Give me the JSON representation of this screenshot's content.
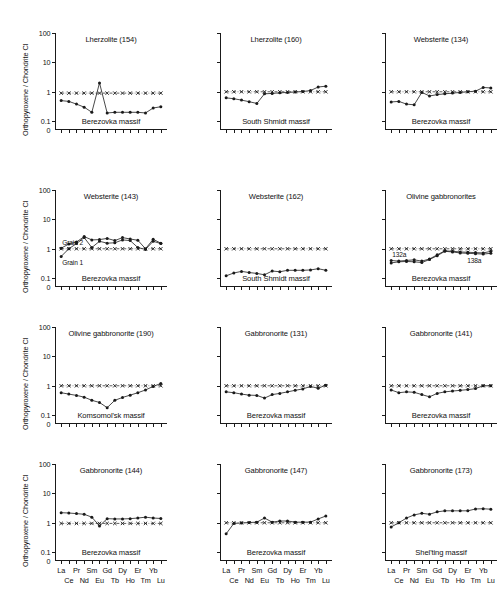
{
  "figure": {
    "y_axis_label": "Orthopyroxene / Chondrite CI",
    "y_ticks": [
      "100",
      "10",
      "1",
      "0.1",
      "0"
    ],
    "x_categories": [
      "La",
      "Ce",
      "Pr",
      "Nd",
      "Sm",
      "Eu",
      "Gd",
      "Tb",
      "Dy",
      "Ho",
      "Er",
      "Tm",
      "Yb",
      "Lu"
    ],
    "x_row_top": [
      "La",
      "Pr",
      "Sm",
      "Gd",
      "Dy",
      "Er",
      "Yb"
    ],
    "x_row_bottom": [
      "Ce",
      "Nd",
      "Eu",
      "Tb",
      "Ho",
      "Tm",
      "Lu"
    ],
    "reference_line_label": "Chondrite CI reference",
    "caption": ""
  },
  "chart_data": [
    {
      "type": "line",
      "title": "Lherzolite (154)",
      "massif": "Berezovka massif",
      "xlabel": "",
      "ylabel": "Orthopyroxene / Chondrite CI",
      "categories": [
        "La",
        "Ce",
        "Pr",
        "Nd",
        "Sm",
        "Eu",
        "Gd",
        "Tb",
        "Dy",
        "Ho",
        "Er",
        "Tm",
        "Yb",
        "Lu"
      ],
      "ylim": [
        0.05,
        100
      ],
      "log_scale": true,
      "series": [
        {
          "name": "sample",
          "marker": "filled-circle",
          "values": [
            0.5,
            0.47,
            0.38,
            0.3,
            0.2,
            2.0,
            0.19,
            0.2,
            0.2,
            0.2,
            0.2,
            0.19,
            0.28,
            0.31
          ]
        },
        {
          "name": "chondrite-reference",
          "marker": "cross",
          "line": "dash-dot",
          "values": [
            0.9,
            0.9,
            0.9,
            0.9,
            0.9,
            0.9,
            0.9,
            0.9,
            0.9,
            0.9,
            0.9,
            0.9,
            0.9,
            0.9
          ]
        }
      ],
      "annotations": []
    },
    {
      "type": "line",
      "title": "Lherzolite (160)",
      "massif": "South Shmidt massif",
      "categories": [
        "La",
        "Ce",
        "Pr",
        "Nd",
        "Sm",
        "Eu",
        "Gd",
        "Tb",
        "Dy",
        "Ho",
        "Er",
        "Tm",
        "Yb",
        "Lu"
      ],
      "ylim": [
        0.05,
        100
      ],
      "log_scale": true,
      "series": [
        {
          "name": "sample",
          "marker": "filled-circle",
          "values": [
            0.62,
            0.58,
            0.52,
            0.46,
            0.4,
            0.85,
            0.88,
            0.92,
            0.95,
            0.98,
            1.02,
            1.1,
            1.45,
            1.55
          ]
        },
        {
          "name": "chondrite-reference",
          "marker": "cross",
          "line": "dash-dot",
          "values": [
            1,
            1,
            1,
            1,
            1,
            1,
            1,
            1,
            1,
            1,
            1,
            1,
            1,
            1
          ]
        }
      ],
      "annotations": []
    },
    {
      "type": "line",
      "title": "Websterite (134)",
      "massif": "Berezovka massif",
      "categories": [
        "La",
        "Ce",
        "Pr",
        "Nd",
        "Sm",
        "Eu",
        "Gd",
        "Tb",
        "Dy",
        "Ho",
        "Er",
        "Tm",
        "Yb",
        "Lu"
      ],
      "ylim": [
        0.05,
        100
      ],
      "log_scale": true,
      "series": [
        {
          "name": "sample",
          "marker": "filled-circle",
          "values": [
            0.45,
            0.47,
            0.38,
            0.36,
            0.95,
            0.72,
            0.8,
            0.85,
            0.9,
            0.95,
            1.0,
            1.05,
            1.4,
            1.35
          ]
        },
        {
          "name": "chondrite-reference",
          "marker": "cross",
          "line": "dash-dot",
          "values": [
            1,
            1,
            1,
            1,
            1,
            1,
            1,
            1,
            1,
            1,
            1,
            1,
            1,
            1
          ]
        }
      ],
      "annotations": []
    },
    {
      "type": "line",
      "title": "Websterite (143)",
      "massif": "Berezovka massif",
      "categories": [
        "La",
        "Ce",
        "Pr",
        "Nd",
        "Sm",
        "Eu",
        "Gd",
        "Tb",
        "Dy",
        "Ho",
        "Er",
        "Tm",
        "Yb",
        "Lu"
      ],
      "ylim": [
        0.05,
        100
      ],
      "log_scale": true,
      "series": [
        {
          "name": "Grain 2",
          "marker": "filled-circle",
          "values": [
            1.05,
            1.45,
            1.7,
            2.6,
            2.0,
            2.05,
            2.25,
            1.9,
            2.4,
            2.15,
            1.95,
            1.0,
            2.1,
            1.55
          ]
        },
        {
          "name": "Grain 1",
          "marker": "filled-circle",
          "values": [
            0.55,
            1.0,
            1.5,
            2.4,
            1.1,
            1.8,
            1.55,
            1.6,
            2.0,
            1.9,
            1.1,
            0.95,
            1.8,
            1.5
          ]
        },
        {
          "name": "chondrite-reference",
          "marker": "cross",
          "line": "dash-dot",
          "values": [
            1,
            1,
            1,
            1,
            1,
            1,
            1,
            1,
            1,
            1,
            1,
            1,
            1,
            1
          ]
        }
      ],
      "annotations": [
        {
          "text": "Grain 2",
          "category": "La",
          "position": "above"
        },
        {
          "text": "Grain 1",
          "category": "La",
          "position": "below"
        }
      ]
    },
    {
      "type": "line",
      "title": "Websterite (162)",
      "massif": "South Shmidt massif",
      "categories": [
        "La",
        "Ce",
        "Pr",
        "Nd",
        "Sm",
        "Eu",
        "Gd",
        "Tb",
        "Dy",
        "Ho",
        "Er",
        "Tm",
        "Yb",
        "Lu"
      ],
      "ylim": [
        0.05,
        100
      ],
      "log_scale": true,
      "series": [
        {
          "name": "sample",
          "marker": "filled-circle",
          "values": [
            0.12,
            0.15,
            0.17,
            0.155,
            0.145,
            0.13,
            0.175,
            0.165,
            0.185,
            0.185,
            0.185,
            0.19,
            0.21,
            0.185
          ]
        },
        {
          "name": "chondrite-reference",
          "marker": "cross",
          "line": "dash-dot",
          "values": [
            1,
            1,
            1,
            1,
            1,
            1,
            1,
            1,
            1,
            1,
            1,
            1,
            1,
            1
          ]
        }
      ],
      "annotations": []
    },
    {
      "type": "line",
      "title": "Olivine gabbronorites",
      "massif": "Berezovka massif",
      "categories": [
        "La",
        "Ce",
        "Pr",
        "Nd",
        "Sm",
        "Eu",
        "Gd",
        "Tb",
        "Dy",
        "Ho",
        "Er",
        "Tm",
        "Yb",
        "Lu"
      ],
      "ylim": [
        0.05,
        100
      ],
      "log_scale": true,
      "series": [
        {
          "name": "132a",
          "marker": "filled-circle",
          "values": [
            0.4,
            0.38,
            0.4,
            0.42,
            0.38,
            0.45,
            0.62,
            0.85,
            0.82,
            0.78,
            0.76,
            0.74,
            0.72,
            0.82
          ]
        },
        {
          "name": "138a",
          "marker": "filled-circle",
          "values": [
            0.33,
            0.36,
            0.37,
            0.36,
            0.34,
            0.43,
            0.58,
            0.82,
            0.78,
            0.72,
            0.7,
            0.68,
            0.66,
            0.7
          ]
        },
        {
          "name": "chondrite-reference",
          "marker": "cross",
          "line": "dash-dot",
          "values": [
            1,
            1,
            1,
            1,
            1,
            1,
            1,
            1,
            1,
            1,
            1,
            1,
            1,
            1
          ]
        }
      ],
      "annotations": [
        {
          "text": "132a",
          "category": "La",
          "position": "above"
        },
        {
          "text": "138a",
          "category": "Yb",
          "position": "below"
        }
      ]
    },
    {
      "type": "line",
      "title": "Olivine gabbronorite (190)",
      "massif": "Komsomol'sk massif",
      "categories": [
        "La",
        "Ce",
        "Pr",
        "Nd",
        "Sm",
        "Eu",
        "Gd",
        "Tb",
        "Dy",
        "Ho",
        "Er",
        "Tm",
        "Yb",
        "Lu"
      ],
      "ylim": [
        0.05,
        100
      ],
      "log_scale": true,
      "series": [
        {
          "name": "sample",
          "marker": "filled-circle",
          "values": [
            0.58,
            0.52,
            0.47,
            0.41,
            0.32,
            0.27,
            0.18,
            0.32,
            0.4,
            0.48,
            0.58,
            0.72,
            0.95,
            1.2
          ]
        },
        {
          "name": "chondrite-reference",
          "marker": "cross",
          "line": "dash-dot",
          "values": [
            1,
            1,
            1,
            1,
            1,
            1,
            1,
            1,
            1,
            1,
            1,
            1,
            1,
            1
          ]
        }
      ],
      "annotations": []
    },
    {
      "type": "line",
      "title": "Gabbronorite (131)",
      "massif": "Berezovka massif",
      "categories": [
        "La",
        "Ce",
        "Pr",
        "Nd",
        "Sm",
        "Eu",
        "Gd",
        "Tb",
        "Dy",
        "Ho",
        "Er",
        "Tm",
        "Yb",
        "Lu"
      ],
      "ylim": [
        0.05,
        100
      ],
      "log_scale": true,
      "series": [
        {
          "name": "sample",
          "marker": "filled-circle",
          "values": [
            0.62,
            0.58,
            0.52,
            0.48,
            0.47,
            0.38,
            0.5,
            0.55,
            0.62,
            0.7,
            0.78,
            0.95,
            0.82,
            1.05
          ]
        },
        {
          "name": "chondrite-reference",
          "marker": "cross",
          "line": "dash-dot",
          "values": [
            1,
            1,
            1,
            1,
            1,
            1,
            1,
            1,
            1,
            1,
            1,
            1,
            1,
            1
          ]
        }
      ],
      "annotations": []
    },
    {
      "type": "line",
      "title": "Gabbronorite (141)",
      "massif": "Berezovka massif",
      "categories": [
        "La",
        "Ce",
        "Pr",
        "Nd",
        "Sm",
        "Eu",
        "Gd",
        "Tb",
        "Dy",
        "Ho",
        "Er",
        "Tm",
        "Yb",
        "Lu"
      ],
      "ylim": [
        0.05,
        100
      ],
      "log_scale": true,
      "series": [
        {
          "name": "sample",
          "marker": "filled-circle",
          "values": [
            0.72,
            0.58,
            0.62,
            0.6,
            0.5,
            0.42,
            0.55,
            0.62,
            0.66,
            0.7,
            0.74,
            0.8,
            1.0,
            1.0
          ]
        },
        {
          "name": "chondrite-reference",
          "marker": "cross",
          "line": "dash-dot",
          "values": [
            1,
            1,
            1,
            1,
            1,
            1,
            1,
            1,
            1,
            1,
            1,
            1,
            1,
            1
          ]
        }
      ],
      "annotations": []
    },
    {
      "type": "line",
      "title": "Gabbronorite (144)",
      "massif": "Berezovka massif",
      "categories": [
        "La",
        "Ce",
        "Pr",
        "Nd",
        "Sm",
        "Eu",
        "Gd",
        "Tb",
        "Dy",
        "Ho",
        "Er",
        "Tm",
        "Yb",
        "Lu"
      ],
      "ylim": [
        0.05,
        100
      ],
      "log_scale": true,
      "series": [
        {
          "name": "sample",
          "marker": "filled-circle",
          "values": [
            2.2,
            2.15,
            2.05,
            1.95,
            1.55,
            0.78,
            1.38,
            1.35,
            1.35,
            1.38,
            1.45,
            1.55,
            1.45,
            1.4
          ]
        },
        {
          "name": "chondrite-reference",
          "marker": "cross",
          "line": "dash-dot",
          "values": [
            0.95,
            0.95,
            0.95,
            0.95,
            0.95,
            0.95,
            0.95,
            0.95,
            0.95,
            0.95,
            0.95,
            0.95,
            0.95,
            0.95
          ]
        }
      ],
      "annotations": []
    },
    {
      "type": "line",
      "title": "Gabbronorite (147)",
      "massif": "Berezovka massif",
      "categories": [
        "La",
        "Ce",
        "Pr",
        "Nd",
        "Sm",
        "Eu",
        "Gd",
        "Tb",
        "Dy",
        "Ho",
        "Er",
        "Tm",
        "Yb",
        "Lu"
      ],
      "ylim": [
        0.05,
        100
      ],
      "log_scale": true,
      "series": [
        {
          "name": "sample",
          "marker": "filled-circle",
          "values": [
            0.42,
            0.95,
            0.98,
            1.02,
            1.05,
            1.45,
            1.05,
            1.15,
            1.15,
            1.05,
            1.05,
            1.05,
            1.35,
            1.7
          ]
        },
        {
          "name": "chondrite-reference",
          "marker": "cross",
          "line": "dash-dot",
          "values": [
            1,
            1,
            1,
            1,
            1,
            1,
            1,
            1,
            1,
            1,
            1,
            1,
            1,
            1
          ]
        }
      ],
      "annotations": []
    },
    {
      "type": "line",
      "title": "Gabbronorite (173)",
      "massif": "Shel'ting massif",
      "categories": [
        "La",
        "Ce",
        "Pr",
        "Nd",
        "Sm",
        "Eu",
        "Gd",
        "Tb",
        "Dy",
        "Ho",
        "Er",
        "Tm",
        "Yb",
        "Lu"
      ],
      "ylim": [
        0.05,
        100
      ],
      "log_scale": true,
      "series": [
        {
          "name": "sample",
          "marker": "filled-circle",
          "values": [
            0.72,
            1.0,
            1.45,
            1.85,
            2.1,
            1.95,
            2.35,
            2.55,
            2.55,
            2.55,
            2.55,
            2.95,
            3.0,
            2.9
          ]
        },
        {
          "name": "chondrite-reference",
          "marker": "cross",
          "line": "dash-dot",
          "values": [
            1,
            1,
            1,
            1,
            1,
            1,
            1,
            1,
            1,
            1,
            1,
            1,
            1,
            1
          ]
        }
      ],
      "annotations": []
    }
  ]
}
